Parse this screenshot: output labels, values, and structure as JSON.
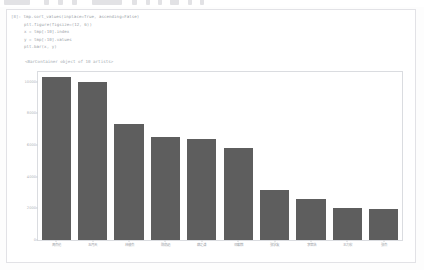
{
  "toolbar": {
    "items": [
      {
        "name": "menu-block",
        "x": 4,
        "w": 26
      },
      {
        "name": "tool-1",
        "x": 44,
        "w": 5
      },
      {
        "name": "tool-2",
        "x": 58,
        "w": 5
      },
      {
        "name": "tool-3",
        "x": 72,
        "w": 5
      },
      {
        "name": "tool-4",
        "x": 92,
        "w": 30
      },
      {
        "name": "tool-5",
        "x": 132,
        "w": 5
      },
      {
        "name": "tool-6",
        "x": 146,
        "w": 4
      },
      {
        "name": "tool-7",
        "x": 158,
        "w": 4
      },
      {
        "name": "tool-8",
        "x": 170,
        "w": 9
      },
      {
        "name": "tool-9",
        "x": 188,
        "w": 4
      },
      {
        "name": "tool-10",
        "x": 200,
        "w": 4
      }
    ]
  },
  "cell": {
    "prompt": "[8]:",
    "code_lines": [
      "tmp.sort_values(inplace=True, ascending=False)",
      "plt.figure(figsize=(12, 6))",
      "x = tmp[:10].index",
      "y = tmp[:10].values",
      "plt.bar(x, y)"
    ]
  },
  "output": {
    "repr_text": "<BarContainer object of 10 artists>"
  },
  "chart_data": {
    "type": "bar",
    "title": "",
    "xlabel": "",
    "ylabel": "",
    "grid": false,
    "legend": null,
    "ylim": [
      0,
      10600
    ],
    "yticks": [
      0,
      2000,
      4000,
      6000,
      8000,
      10000
    ],
    "ytick_labels": [
      "0",
      "2000",
      "4000",
      "6000",
      "8000",
      "10000"
    ],
    "bar_color": "#5e5e5e",
    "bar_width_ratio": 0.8,
    "categories": [
      "周杰伦",
      "五月天",
      "林俊杰",
      "陈奕迅",
      "薛之谦",
      "邓紫棋",
      "张学友",
      "李荣浩",
      "王力宏",
      "张杰"
    ],
    "values": [
      10300,
      9950,
      7350,
      6500,
      6400,
      5800,
      3150,
      2600,
      2000,
      1950
    ]
  }
}
